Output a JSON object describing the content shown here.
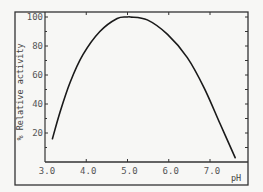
{
  "chart_data": {
    "type": "line",
    "title": "",
    "xlabel": "pH",
    "ylabel": "% Relative activity",
    "xlim": [
      3.0,
      7.9
    ],
    "ylim": [
      0,
      102
    ],
    "x_ticks": [
      "3.0",
      "4.0",
      "5.0",
      "6.0",
      "7.0"
    ],
    "y_ticks": [
      "20",
      "40",
      "60",
      "80",
      "100"
    ],
    "grid": false,
    "legend": null,
    "series": [
      {
        "name": "Relative activity",
        "x": [
          3.18,
          3.36,
          3.61,
          3.92,
          4.33,
          4.75,
          5.07,
          5.0,
          5.48,
          5.97,
          6.45,
          6.86,
          7.25,
          7.61
        ],
        "y": [
          16,
          34,
          55,
          74,
          90,
          99,
          100,
          100,
          98,
          88,
          72,
          51,
          26,
          3
        ]
      }
    ],
    "color": "#1a1a1a"
  }
}
